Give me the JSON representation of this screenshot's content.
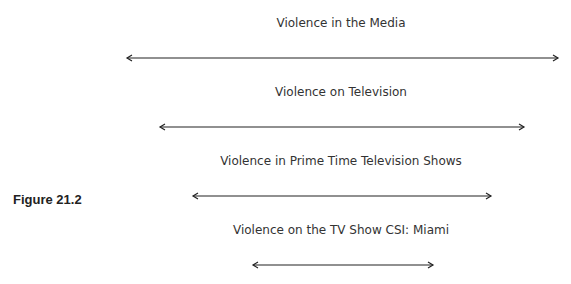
{
  "figure_label": "Figure 21.2",
  "levels": [
    {
      "label": "Violence in the Media",
      "x1": 127,
      "x2": 558,
      "y": 58,
      "label_y": 16
    },
    {
      "label": "Violence on Television",
      "x1": 160,
      "x2": 524,
      "y": 127,
      "label_y": 85
    },
    {
      "label": "Violence in Prime Time Television Shows",
      "x1": 193,
      "x2": 491,
      "y": 196,
      "label_y": 154
    },
    {
      "label": "Violence on the TV Show CSI: Miami",
      "x1": 253,
      "x2": 433,
      "y": 265,
      "label_y": 223
    }
  ]
}
